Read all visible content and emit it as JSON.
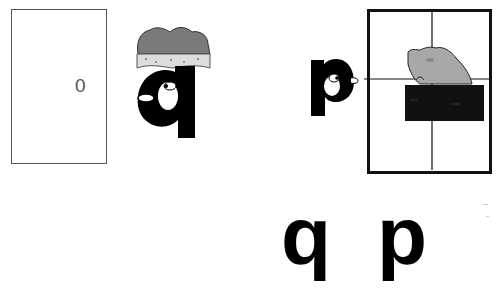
{
  "scene": {
    "door": {
      "label": "0"
    },
    "characters": [
      {
        "letter": "q",
        "accessory": "crown",
        "facing": "left"
      },
      {
        "letter": "p",
        "accessory": "none",
        "facing": "right"
      }
    ],
    "window": {
      "content": "frog-on-bush",
      "panes": 4
    },
    "letters": {
      "left": "q",
      "right": "p"
    }
  },
  "colors": {
    "ink": "#000000",
    "frame": "#111111",
    "crown": "#7a7a7a",
    "crown_trim": "#d8d8d8",
    "frog": "#a8a8a8",
    "bush": "#111111"
  }
}
